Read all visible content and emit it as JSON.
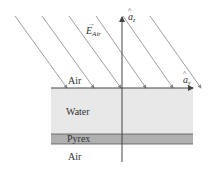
{
  "diagram": {
    "labels": {
      "field": "E",
      "field_sub": "Air",
      "axis_z": "a",
      "axis_z_sub": "z",
      "axis_y": "a",
      "axis_y_sub": "y",
      "air_top": "Air",
      "water": "Water",
      "pyrex": "Pyrex",
      "air_bottom": "Air"
    },
    "colors": {
      "water": "#e8e8e8",
      "pyrex": "#b0b0b0",
      "rays": "#888888",
      "axis": "#444444"
    }
  }
}
